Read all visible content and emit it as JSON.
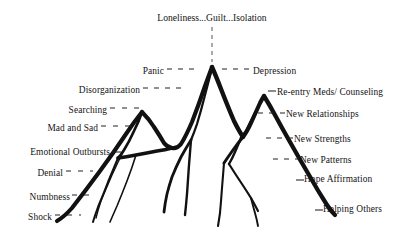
{
  "diagram": {
    "title": "Loneliness...Guilt...Isolation",
    "type": "grief-mountain-diagram",
    "ink_color": "#111111",
    "background_color": "#ffffff",
    "left_labels": [
      {
        "text": "Panic",
        "x_right": 164,
        "y": 72,
        "dash": "long"
      },
      {
        "text": "Disorganization",
        "x_right": 140,
        "y": 91,
        "dash": "long"
      },
      {
        "text": "Searching",
        "x_right": 107,
        "y": 111,
        "dash": "long"
      },
      {
        "text": "Mad and Sad",
        "x_right": 98,
        "y": 129,
        "dash": "long"
      },
      {
        "text": "Emotional Outbursts",
        "x_right": 110,
        "y": 152,
        "dash": "short"
      },
      {
        "text": "Denial",
        "x_right": 63,
        "y": 174,
        "dash": "med"
      },
      {
        "text": "Numbness",
        "x_right": 70,
        "y": 198,
        "dash": "med"
      },
      {
        "text": "Shock",
        "x_right": 52,
        "y": 218,
        "dash": "med"
      }
    ],
    "right_labels": [
      {
        "text": "Depression",
        "x_left": 253,
        "y": 72,
        "dash": "long"
      },
      {
        "text": "Re-entry Meds/ Counseling",
        "x_left": 277,
        "y": 93,
        "dash": "short"
      },
      {
        "text": "New Relationships",
        "x_left": 286,
        "y": 116,
        "dash": "long"
      },
      {
        "text": "New Strengths",
        "x_left": 294,
        "y": 141,
        "dash": "long"
      },
      {
        "text": "New Patterns",
        "x_left": 300,
        "y": 162,
        "dash": "long"
      },
      {
        "text": "Hope Affirmation",
        "x_left": 302,
        "y": 180,
        "dash": "short"
      },
      {
        "text": "Helping Others",
        "x_left": 321,
        "y": 210,
        "dash": "short"
      }
    ],
    "connectors": {
      "title_stem": {
        "x": 212,
        "y_top": 27,
        "y_bottom": 62
      }
    },
    "peaks": [
      {
        "name": "searching-peak",
        "x": 142,
        "y": 112
      },
      {
        "name": "panic-peak",
        "x": 212,
        "y": 67
      },
      {
        "name": "re-entry-peak",
        "x": 264,
        "y": 96
      }
    ]
  }
}
